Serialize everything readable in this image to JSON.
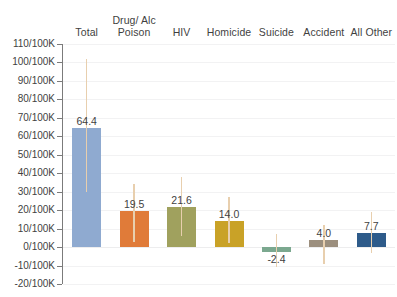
{
  "chart_data": {
    "type": "bar",
    "title": "",
    "subtitle": "",
    "xlabel": "",
    "ylabel": "",
    "ylim": [
      -20,
      110
    ],
    "ytick_step": 10,
    "ytick_suffix": "/100K",
    "grid": true,
    "legend": false,
    "category_label_position": "top",
    "error_bars": true,
    "categories": [
      "Total",
      "Drug/ Alc\nPoison",
      "HIV",
      "Homicide",
      "Suicide",
      "Accident",
      "All Other"
    ],
    "values": [
      64.4,
      19.5,
      21.6,
      14.0,
      -2.4,
      4.0,
      7.7
    ],
    "value_labels": [
      "64.4",
      "19.5",
      "21.6",
      "14.0",
      "-2.4",
      "4.0",
      "7.7"
    ],
    "error_low": [
      30.0,
      3.0,
      6.0,
      2.0,
      -11.0,
      -9.0,
      -3.0
    ],
    "error_high": [
      102.0,
      34.0,
      38.0,
      27.0,
      7.0,
      12.0,
      19.0
    ],
    "bar_colors": [
      "#8faad0",
      "#e07b39",
      "#a0a15e",
      "#c9a227",
      "#7ba88f",
      "#9c8f7e",
      "#2e5b8a"
    ],
    "error_bar_color": "#e8cfae",
    "ytick_labels": [
      "110/100K",
      "100/100K",
      "90/100K",
      "80/100K",
      "70/100K",
      "60/100K",
      "50/100K",
      "40/100K",
      "30/100K",
      "20/100K",
      "10/100K",
      "0/100K",
      "-10/100K",
      "-20/100K"
    ],
    "ytick_values": [
      110,
      100,
      90,
      80,
      70,
      60,
      50,
      40,
      30,
      20,
      10,
      0,
      -10,
      -20
    ]
  },
  "colors": {
    "background": "#ffffff",
    "gridline": "#f2f2f3",
    "axis": "#7b7b7b",
    "text": "#3f3f3f"
  }
}
